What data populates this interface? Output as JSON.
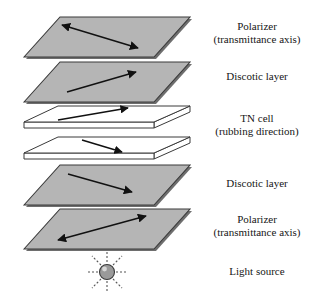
{
  "diagram": {
    "background_color": "#ffffff",
    "layer_fill_color": "#b5b5b5",
    "layer_stroke_color": "#3a3a3a",
    "layer_shadow_color": "#6e6e6e",
    "plate_fill_color": "#ffffff",
    "arrow_color": "#111111",
    "light_source_color": "#9a9a9a"
  },
  "labels": {
    "polarizer_top": {
      "line1": "Polarizer",
      "line2": "(transmittance axis)"
    },
    "discotic_top": {
      "line1": "Discotic layer",
      "line2": ""
    },
    "tn_cell": {
      "line1": "TN cell",
      "line2": "(rubbing direction)"
    },
    "discotic_bottom": {
      "line1": "Discotic layer",
      "line2": ""
    },
    "polarizer_bottom": {
      "line1": "Polarizer",
      "line2": "(transmittance axis)"
    },
    "light_source": {
      "line1": "Light source",
      "line2": ""
    }
  },
  "layers": [
    {
      "id": "polarizer-top",
      "type": "shaded-parallelogram",
      "arrow": "double-headed",
      "arrow_direction": "lower-right to upper-left"
    },
    {
      "id": "discotic-top",
      "type": "shaded-parallelogram",
      "arrow": "single-headed",
      "arrow_direction": "lower-left to upper-right"
    },
    {
      "id": "tn-cell-upper-plate",
      "type": "white-slab",
      "arrow": "single-headed",
      "arrow_direction": "lower-left to upper-right"
    },
    {
      "id": "tn-cell-lower-plate",
      "type": "white-slab",
      "arrow": "single-headed",
      "arrow_direction": "upper-left to lower-right"
    },
    {
      "id": "discotic-bottom",
      "type": "shaded-parallelogram",
      "arrow": "single-headed",
      "arrow_direction": "upper-left to lower-right"
    },
    {
      "id": "polarizer-bottom",
      "type": "shaded-parallelogram",
      "arrow": "double-headed",
      "arrow_direction": "lower-left to upper-right"
    },
    {
      "id": "light-source",
      "type": "sphere-with-rays",
      "rays": 8
    }
  ]
}
